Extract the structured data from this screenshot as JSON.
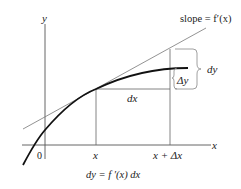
{
  "diagram": {
    "type": "differential-approximation",
    "labels": {
      "y_axis": "y",
      "x_axis": "x",
      "origin": "0",
      "x_tick": "x",
      "x_delta_tick": "x + Δx",
      "slope": "slope = f′(x)",
      "dx": "dx",
      "dy": "dy",
      "delta_y": "Δy",
      "formula": "dy = f ′(x) dx"
    },
    "colors": {
      "curve": "#111111",
      "tangent": "#777777",
      "axes": "#555555",
      "guides": "#666666",
      "brace": "#888888",
      "text": "#222222"
    }
  }
}
